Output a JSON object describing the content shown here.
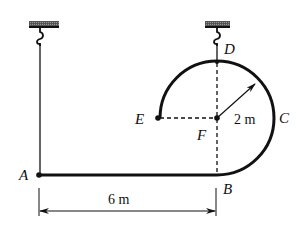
{
  "diagram": {
    "points": {
      "A": "A",
      "B": "B",
      "C": "C",
      "D": "D",
      "E": "E",
      "F": "F"
    },
    "dimensions": {
      "length_AB": "6 m",
      "radius": "2 m"
    },
    "colors": {
      "line": "#111111",
      "support": "#333333"
    }
  }
}
